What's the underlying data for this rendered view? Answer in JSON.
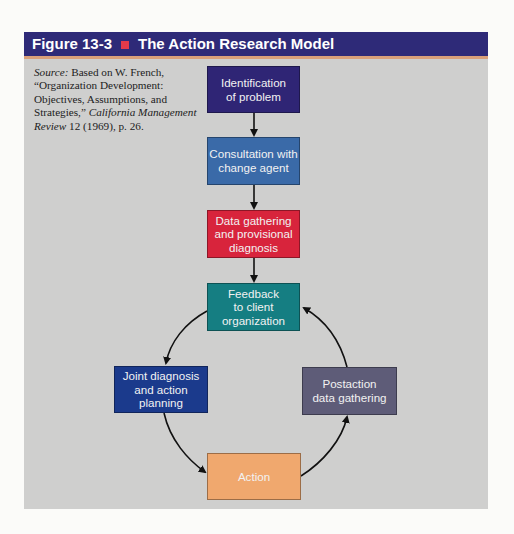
{
  "figure": {
    "label": "Figure 13-3",
    "title": "The Action Research Model",
    "marker_color": "#e23a4a",
    "header_color": "#2e2a78"
  },
  "source": {
    "prefix": "Source:",
    "text": " Based on W. French, “Organization Development: Objectives, Assumptions, and Strategies,” ",
    "journal": "California Management Review",
    "citation": " 12 (1969), p. 26."
  },
  "steps": [
    {
      "id": "identification",
      "label": "Identification\nof problem",
      "color": "#2f2575"
    },
    {
      "id": "consultation",
      "label": "Consultation with\nchange agent",
      "color": "#3a6aa8"
    },
    {
      "id": "data-gathering",
      "label": "Data gathering\nand provisional\ndiagnosis",
      "color": "#d8243c"
    },
    {
      "id": "feedback",
      "label": "Feedback\nto client\norganization",
      "color": "#157e82"
    },
    {
      "id": "joint-diagnosis",
      "label": "Joint diagnosis\nand action\nplanning",
      "color": "#1b3a8c"
    },
    {
      "id": "action",
      "label": "Action",
      "color": "#f0a86e"
    },
    {
      "id": "postaction",
      "label": "Postaction\ndata gathering",
      "color": "#5e5c78"
    }
  ],
  "flow": [
    [
      "Identification of problem",
      "Consultation with change agent"
    ],
    [
      "Consultation with change agent",
      "Data gathering and provisional diagnosis"
    ],
    [
      "Data gathering and provisional diagnosis",
      "Feedback to client organization"
    ],
    [
      "Feedback to client organization",
      "Joint diagnosis and action planning"
    ],
    [
      "Joint diagnosis and action planning",
      "Action"
    ],
    [
      "Action",
      "Postaction data gathering"
    ],
    [
      "Postaction data gathering",
      "Feedback to client organization"
    ]
  ]
}
